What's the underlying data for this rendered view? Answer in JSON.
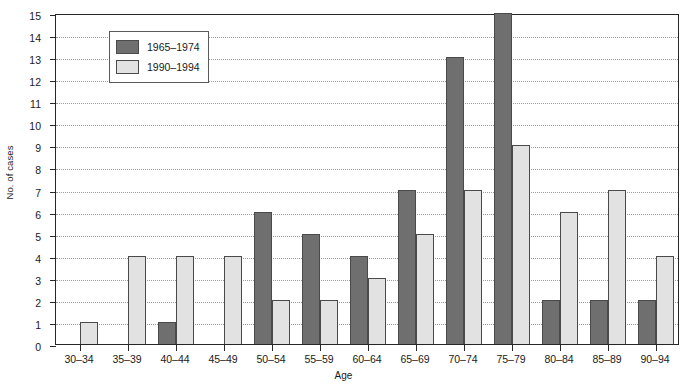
{
  "chart_data": {
    "type": "bar",
    "title": "",
    "xlabel": "Age",
    "ylabel": "No. of cases",
    "ylim": [
      0,
      15
    ],
    "ytick_step": 1,
    "yticks": [
      0,
      1,
      2,
      3,
      4,
      5,
      6,
      7,
      8,
      9,
      10,
      11,
      12,
      13,
      14,
      15
    ],
    "grid": true,
    "grid_axis": "y",
    "legend_position": "upper left",
    "categories": [
      "30–34",
      "35–39",
      "40–44",
      "45–49",
      "50–54",
      "55–59",
      "60–64",
      "65–69",
      "70–74",
      "75–79",
      "80–84",
      "85–89",
      "90–94"
    ],
    "series": [
      {
        "name": "1965–1974",
        "color": "#6f6f6f",
        "values": [
          0,
          0,
          1,
          0,
          6,
          5,
          4,
          7,
          13,
          15,
          2,
          2,
          2
        ]
      },
      {
        "name": "1990–1994",
        "color": "#e2e2e2",
        "values": [
          1,
          4,
          4,
          4,
          2,
          2,
          3,
          5,
          7,
          9,
          6,
          7,
          4
        ]
      }
    ]
  },
  "axes": {
    "y_title": "No. of cases",
    "x_title": "Age"
  },
  "legend": {
    "items": [
      {
        "label": "1965–1974",
        "swatch": "series-dark"
      },
      {
        "label": "1990–1994",
        "swatch": "series-light"
      }
    ]
  },
  "colors": {
    "series_dark": "#6f6f6f",
    "series_light": "#e2e2e2",
    "axis": "#262626",
    "grid": "#9a9a9a",
    "background": "#ffffff"
  }
}
